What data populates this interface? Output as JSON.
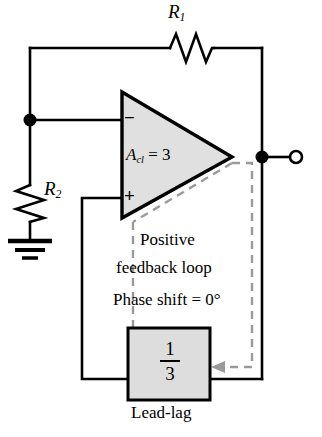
{
  "diagram": {
    "colors": {
      "wire": "#000000",
      "amp_fill": "#e0e0e0",
      "block_fill": "#dddddd",
      "dashed_loop": "#9a9a9a",
      "background": "#ffffff"
    }
  },
  "components": {
    "r1": {
      "name": "R",
      "subscript": "1",
      "type": "resistor",
      "orientation": "horizontal"
    },
    "r2": {
      "name": "R",
      "subscript": "2",
      "type": "resistor",
      "orientation": "vertical"
    },
    "opamp": {
      "gain_symbol": "A",
      "gain_subscript": "cl",
      "gain_equals": " = 3",
      "inverting_pin": "−",
      "noninverting_pin": "+"
    },
    "leadlag": {
      "numerator": "1",
      "denominator": "3",
      "caption": "Lead-lag"
    },
    "ground": {
      "type": "earth-ground",
      "bars": 3
    },
    "output_terminal": {
      "type": "open-circle"
    }
  },
  "annotations": {
    "loop_line1": "Positive",
    "loop_line2": "feedback loop",
    "loop_line3": "Phase shift = 0°"
  }
}
